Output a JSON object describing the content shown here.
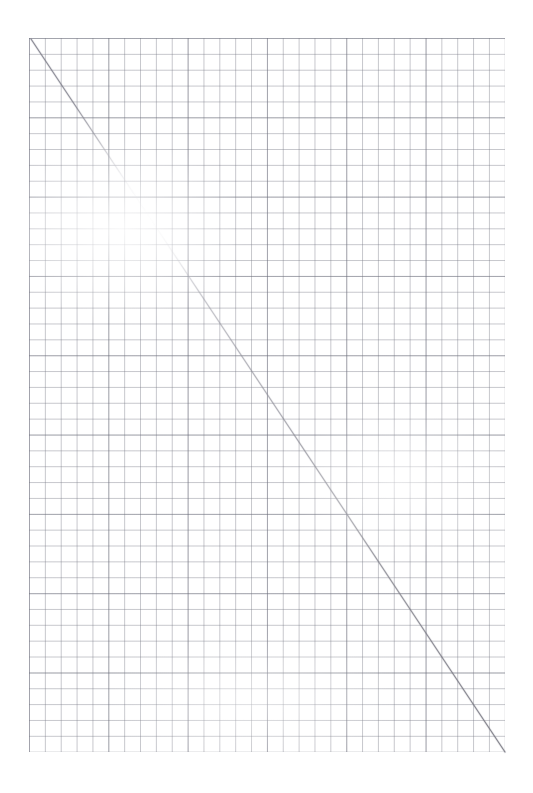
{
  "document": {
    "kind": "scanned-graph-paper",
    "title": "Graph paper sheet with hand-drawn diagonal",
    "background_color": "#ffffff",
    "width": 533,
    "height": 793
  },
  "paper": {
    "color": "#ffffff",
    "margin_left": 29,
    "margin_top": 38,
    "margin_right": 28,
    "margin_bottom": 41
  },
  "grid": {
    "x": 29,
    "y": 38,
    "width": 476,
    "height": 714,
    "cell_size": 15.8667,
    "columns": 30,
    "rows": 45,
    "minor_line_color": "#787a86",
    "minor_line_opacity": 0.42,
    "minor_line_width": 0.7,
    "major_every": 5,
    "major_line_color": "#686a78",
    "major_line_opacity": 0.38,
    "major_line_width": 0.8
  },
  "annotation": {
    "name": "hand-drawn-diagonal",
    "kind": "pencil-line",
    "start": {
      "x": 31,
      "y": 39
    },
    "end": {
      "x": 505,
      "y": 752
    },
    "color": "#8e8e96",
    "stroke_width": 1.1,
    "description": "Faint graphite diagonal from top-left grid corner to bottom-right grid corner; fades almost completely between y 150 and 235, darkest in the lower-right third.",
    "segments": [
      {
        "from_y": 39,
        "to_y": 150,
        "opacity": 0.8,
        "color": "#7e7e88"
      },
      {
        "from_y": 150,
        "to_y": 196,
        "opacity": 0.3,
        "color": "#aeaeb6"
      },
      {
        "from_y": 196,
        "to_y": 236,
        "opacity": 0.1,
        "color": "#cfcfd6"
      },
      {
        "from_y": 236,
        "to_y": 330,
        "opacity": 0.45,
        "color": "#9c9ca6"
      },
      {
        "from_y": 330,
        "to_y": 470,
        "opacity": 0.62,
        "color": "#919199"
      },
      {
        "from_y": 470,
        "to_y": 600,
        "opacity": 0.72,
        "color": "#8a8a93"
      },
      {
        "from_y": 600,
        "to_y": 752,
        "opacity": 0.88,
        "color": "#7c7c86"
      }
    ]
  },
  "chart_data": {
    "type": "line",
    "title": "",
    "xlabel": "",
    "ylabel": "",
    "grid": true,
    "legend": "none",
    "xlim": [
      0,
      30
    ],
    "ylim": [
      0,
      45
    ],
    "series": [
      {
        "name": "hand-drawn-diagonal",
        "x": [
          0,
          30
        ],
        "y": [
          45,
          0
        ],
        "color": "#8e8e96",
        "style": "solid"
      }
    ],
    "xticks": [
      0,
      5,
      10,
      15,
      20,
      25,
      30
    ],
    "yticks": [
      0,
      5,
      10,
      15,
      20,
      25,
      30,
      35,
      40,
      45
    ],
    "xticklabels": [
      "",
      "",
      "",
      "",
      "",
      "",
      ""
    ],
    "yticklabels": [
      "",
      "",
      "",
      "",
      "",
      "",
      "",
      "",
      "",
      ""
    ]
  }
}
